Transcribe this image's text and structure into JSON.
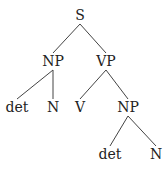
{
  "tree": {
    "nodes": [
      {
        "id": "S",
        "label": "S",
        "x": 80,
        "y": 20
      },
      {
        "id": "NP1",
        "label": "NP",
        "x": 53,
        "y": 66
      },
      {
        "id": "VP",
        "label": "VP",
        "x": 106,
        "y": 66
      },
      {
        "id": "det1",
        "label": "det",
        "x": 17,
        "y": 112
      },
      {
        "id": "N1",
        "label": "N",
        "x": 53,
        "y": 112
      },
      {
        "id": "V",
        "label": "V",
        "x": 80,
        "y": 112
      },
      {
        "id": "NP2",
        "label": "NP",
        "x": 128,
        "y": 112
      },
      {
        "id": "det2",
        "label": "det",
        "x": 110,
        "y": 159
      },
      {
        "id": "N2",
        "label": "N",
        "x": 156,
        "y": 159
      }
    ],
    "edges": [
      [
        "S",
        "NP1"
      ],
      [
        "S",
        "VP"
      ],
      [
        "NP1",
        "det1"
      ],
      [
        "NP1",
        "N1"
      ],
      [
        "VP",
        "V"
      ],
      [
        "VP",
        "NP2"
      ],
      [
        "NP2",
        "det2"
      ],
      [
        "NP2",
        "N2"
      ]
    ]
  }
}
